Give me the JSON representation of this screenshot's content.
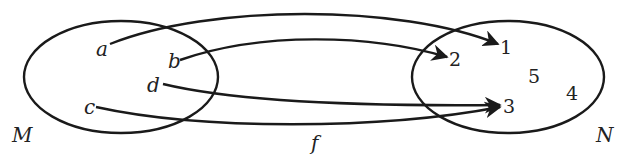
{
  "diagram": {
    "title": "",
    "mapping_label": "f",
    "sets": [
      {
        "id": "M",
        "label": "M",
        "elements": [
          "a",
          "b",
          "d",
          "c"
        ]
      },
      {
        "id": "N",
        "label": "N",
        "elements": [
          "1",
          "2",
          "5",
          "4",
          "3"
        ]
      }
    ],
    "mappings": [
      {
        "from": "a",
        "to": "1"
      },
      {
        "from": "b",
        "to": "2"
      },
      {
        "from": "d",
        "to": "3"
      },
      {
        "from": "c",
        "to": "3"
      }
    ],
    "labels": {
      "M": "M",
      "N": "N",
      "f": "f",
      "a": "a",
      "b": "b",
      "c": "c",
      "d": "d",
      "n1": "1",
      "n2": "2",
      "n3": "3",
      "n4": "4",
      "n5": "5"
    },
    "colors": {
      "stroke": "#1a1a1a",
      "background": "#ffffff"
    }
  }
}
